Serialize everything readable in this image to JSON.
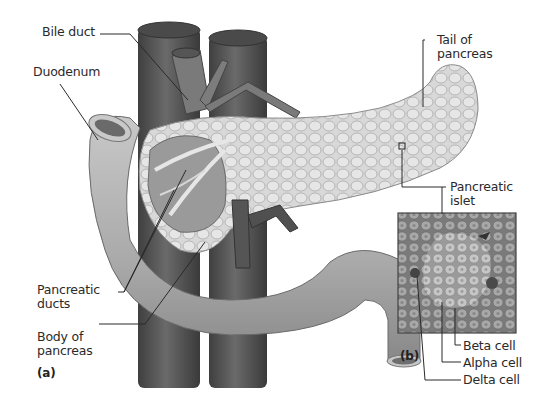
{
  "figure": {
    "style": "grayscale anatomical illustration",
    "panels": [
      {
        "id": "a",
        "label": "(a)",
        "content": "Pancreas with duodenum, bile duct, blood vessels"
      },
      {
        "id": "b",
        "label": "(b)",
        "content": "Micrograph of pancreatic islet"
      }
    ]
  },
  "labels": {
    "bile_duct": "Bile duct",
    "duodenum": "Duodenum",
    "tail_of_pancreas": "Tail of\npancreas",
    "pancreatic_islet": "Pancreatic\nislet",
    "pancreatic_ducts": "Pancreatic\nducts",
    "body_of_pancreas": "Body of\npancreas",
    "beta_cell": "Beta cell",
    "alpha_cell": "Alpha cell",
    "delta_cell": "Delta cell",
    "panel_a": "(a)",
    "panel_b": "(b)"
  },
  "colors": {
    "background": "#ffffff",
    "vessel": "#5a5a5a",
    "duodenum": "#b8b8b8",
    "pancreas": "#d6d6d6",
    "micrograph": "#8e8e8e",
    "leader_line": "#2a2a2a"
  }
}
